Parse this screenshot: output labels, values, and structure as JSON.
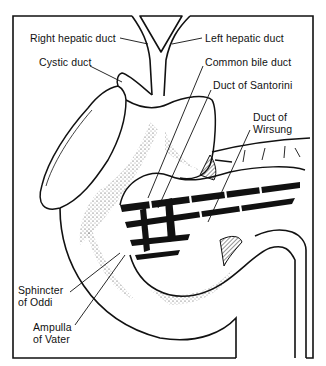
{
  "figure": {
    "colors": {
      "ink": "#111111",
      "paper": "#ffffff",
      "stipple": "#333333"
    }
  },
  "labels": {
    "right_hepatic_duct": "Right hepatic duct",
    "left_hepatic_duct": "Left hepatic duct",
    "cystic_duct": "Cystic duct",
    "common_bile_duct": "Common bile duct",
    "duct_of_santorini": "Duct of Santorini",
    "duct_of_wirsung": {
      "line1": "Duct of",
      "line2": "Wirsung"
    },
    "sphincter_of_oddi": {
      "line1": "Sphincter",
      "line2": "of Oddi"
    },
    "ampulla_of_vater": {
      "line1": "Ampulla",
      "line2": "of Vater"
    }
  }
}
